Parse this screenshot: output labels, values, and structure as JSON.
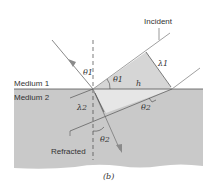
{
  "figure": {
    "caption": "(b)",
    "labels": {
      "incident": "Incident",
      "refracted": "Refracted",
      "medium1": "Medium 1",
      "medium2": "Medium 2",
      "theta1_normal": "θ1",
      "theta1_wavefront": "θ1",
      "theta2_wavefront": "θ2",
      "theta2_normal": "θ2",
      "lambda1": "λ1",
      "lambda2": "λ2",
      "h": "h"
    },
    "colors": {
      "medium2": "#c9c9c9",
      "incident_wedge": "#d6d6d6",
      "refracted_wedge": "#e4e4e4",
      "ray": "#8a8a8a",
      "line": "#555555"
    }
  }
}
